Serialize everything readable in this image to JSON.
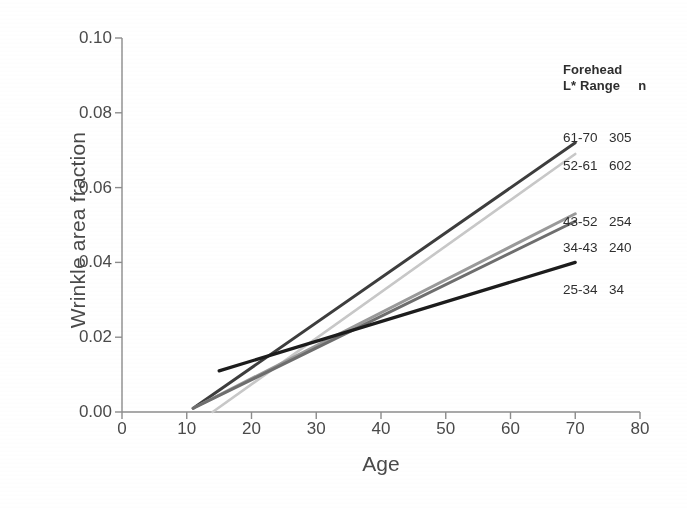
{
  "chart_data": {
    "type": "line",
    "title": "",
    "xlabel": "Age",
    "ylabel": "Wrinkle area fraction",
    "xlim": [
      0,
      80
    ],
    "ylim": [
      0,
      0.1
    ],
    "xticks": [
      0,
      10,
      20,
      30,
      40,
      50,
      60,
      70,
      80
    ],
    "xtick_labels": [
      "0",
      "10",
      "20",
      "30",
      "40",
      "50",
      "60",
      "70",
      "80"
    ],
    "yticks": [
      0.0,
      0.02,
      0.04,
      0.06,
      0.08,
      0.1
    ],
    "ytick_labels": [
      "0.00",
      "0.02",
      "0.04",
      "0.06",
      "0.08",
      "0.10"
    ],
    "grid": false,
    "legend_position": "right-top",
    "legend_title_line1": "Forehead",
    "legend_title_line2": "L* Range",
    "legend_count_header": "n",
    "series": [
      {
        "name": "61-70",
        "n": "305",
        "color": "#3d3d3d",
        "width": 3.0,
        "x": [
          11,
          70
        ],
        "y": [
          0.001,
          0.072
        ]
      },
      {
        "name": "52-61",
        "n": "602",
        "color": "#c8c8c8",
        "width": 2.6,
        "x": [
          14,
          70
        ],
        "y": [
          0.0,
          0.069
        ]
      },
      {
        "name": "43-52",
        "n": "254",
        "color": "#9a9a9a",
        "width": 3.0,
        "x": [
          11,
          70
        ],
        "y": [
          0.001,
          0.053
        ]
      },
      {
        "name": "34-43",
        "n": "240",
        "color": "#6e6e6e",
        "width": 3.0,
        "x": [
          11,
          70
        ],
        "y": [
          0.001,
          0.051
        ]
      },
      {
        "name": "25-34",
        "n": "34",
        "color": "#1c1c1c",
        "width": 3.2,
        "x": [
          15,
          70
        ],
        "y": [
          0.011,
          0.04
        ]
      }
    ],
    "legend_rows": [
      {
        "range": "61-70",
        "n": "305"
      },
      {
        "range": "52-61",
        "n": "602"
      },
      {
        "range": "43-52",
        "n": "254"
      },
      {
        "range": "34-43",
        "n": "240"
      },
      {
        "range": "25-34",
        "n": "34"
      }
    ],
    "axis_color": "#8c8c8c"
  }
}
